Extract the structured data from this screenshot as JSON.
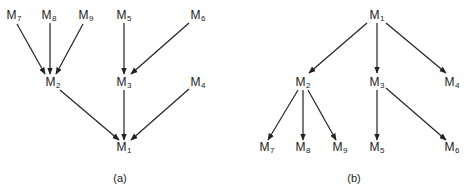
{
  "panels": [
    {
      "id": "a",
      "caption": "(a)",
      "caption_pos": [
        120,
        178
      ],
      "nodes": [
        {
          "id": "M7",
          "base": "M",
          "sub": "7",
          "pos": [
            14,
            16
          ]
        },
        {
          "id": "M8",
          "base": "M",
          "sub": "8",
          "pos": [
            49,
            16
          ]
        },
        {
          "id": "M9",
          "base": "M",
          "sub": "9",
          "pos": [
            86,
            16
          ]
        },
        {
          "id": "M5",
          "base": "M",
          "sub": "5",
          "pos": [
            124,
            16
          ]
        },
        {
          "id": "M6",
          "base": "M",
          "sub": "6",
          "pos": [
            198,
            16
          ]
        },
        {
          "id": "M2",
          "base": "M",
          "sub": "2",
          "pos": [
            53,
            83
          ]
        },
        {
          "id": "M3",
          "base": "M",
          "sub": "3",
          "pos": [
            124,
            83
          ]
        },
        {
          "id": "M4",
          "base": "M",
          "sub": "4",
          "pos": [
            198,
            83
          ]
        },
        {
          "id": "M1",
          "base": "M",
          "sub": "1",
          "pos": [
            124,
            148
          ]
        }
      ],
      "edges": [
        {
          "from": "M7",
          "to": "M2",
          "line": [
            17,
            24,
            45,
            74
          ]
        },
        {
          "from": "M8",
          "to": "M2",
          "line": [
            50,
            23,
            50,
            74
          ]
        },
        {
          "from": "M9",
          "to": "M2",
          "line": [
            83,
            24,
            56,
            74
          ]
        },
        {
          "from": "M5",
          "to": "M3",
          "line": [
            124,
            23,
            124,
            74
          ]
        },
        {
          "from": "M6",
          "to": "M3",
          "line": [
            189,
            23,
            131,
            74
          ]
        },
        {
          "from": "M2",
          "to": "M1",
          "line": [
            60,
            90,
            119,
            140
          ]
        },
        {
          "from": "M3",
          "to": "M1",
          "line": [
            124,
            90,
            124,
            140
          ]
        },
        {
          "from": "M4",
          "to": "M1",
          "line": [
            189,
            89,
            131,
            140
          ]
        }
      ]
    },
    {
      "id": "b",
      "caption": "(b)",
      "caption_pos": [
        354,
        178
      ],
      "nodes": [
        {
          "id": "M1",
          "base": "M",
          "sub": "1",
          "pos": [
            377,
            16
          ]
        },
        {
          "id": "M2",
          "base": "M",
          "sub": "2",
          "pos": [
            303,
            83
          ]
        },
        {
          "id": "M3",
          "base": "M",
          "sub": "3",
          "pos": [
            377,
            83
          ]
        },
        {
          "id": "M4",
          "base": "M",
          "sub": "4",
          "pos": [
            452,
            83
          ]
        },
        {
          "id": "M7",
          "base": "M",
          "sub": "7",
          "pos": [
            267,
            148
          ]
        },
        {
          "id": "M8",
          "base": "M",
          "sub": "8",
          "pos": [
            303,
            148
          ]
        },
        {
          "id": "M9",
          "base": "M",
          "sub": "9",
          "pos": [
            340,
            148
          ]
        },
        {
          "id": "M5",
          "base": "M",
          "sub": "5",
          "pos": [
            377,
            148
          ]
        },
        {
          "id": "M6",
          "base": "M",
          "sub": "6",
          "pos": [
            452,
            148
          ]
        }
      ],
      "edges": [
        {
          "from": "M1",
          "to": "M2",
          "line": [
            367,
            23,
            309,
            73
          ]
        },
        {
          "from": "M1",
          "to": "M3",
          "line": [
            377,
            23,
            377,
            73
          ]
        },
        {
          "from": "M1",
          "to": "M4",
          "line": [
            386,
            23,
            446,
            73
          ]
        },
        {
          "from": "M2",
          "to": "M7",
          "line": [
            298,
            90,
            268,
            140
          ]
        },
        {
          "from": "M2",
          "to": "M8",
          "line": [
            303,
            90,
            303,
            140
          ]
        },
        {
          "from": "M2",
          "to": "M9",
          "line": [
            308,
            90,
            336,
            140
          ]
        },
        {
          "from": "M3",
          "to": "M5",
          "line": [
            377,
            90,
            377,
            140
          ]
        },
        {
          "from": "M3",
          "to": "M6",
          "line": [
            386,
            88,
            446,
            140
          ]
        }
      ]
    }
  ],
  "colors": {
    "stroke": "#222222",
    "text": "#222222",
    "background": "#ffffff"
  }
}
